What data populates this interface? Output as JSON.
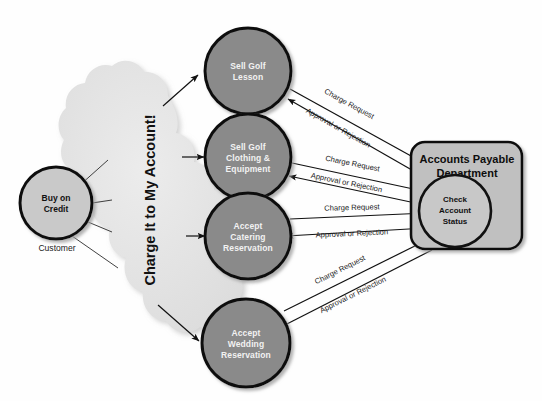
{
  "diagram": {
    "background_color": "#fefefe",
    "actor": {
      "label": "Customer",
      "node_label_line1": "Buy on",
      "node_label_line2": "Credit",
      "fill": "#c9c9c9",
      "stroke": "#111111"
    },
    "cloud": {
      "text": "Charge It to My Account!",
      "fill": "#e2e2e2"
    },
    "processes": [
      {
        "id": "sell-golf-lesson",
        "lines": [
          "Sell Golf",
          "Lesson"
        ],
        "fill": "#8a8a8a"
      },
      {
        "id": "sell-golf-clothing-equipment",
        "lines": [
          "Sell Golf",
          "Clothing &",
          "Equipment"
        ],
        "fill": "#8a8a8a"
      },
      {
        "id": "accept-catering-reservation",
        "lines": [
          "Accept",
          "Catering",
          "Reservation"
        ],
        "fill": "#8a8a8a"
      },
      {
        "id": "accept-wedding-reservation",
        "lines": [
          "Accept",
          "Wedding",
          "Reservation"
        ],
        "fill": "#8a8a8a"
      }
    ],
    "department": {
      "title_line1": "Accounts Payable",
      "title_line2": "Department",
      "fill": "#c0c0c0",
      "stroke": "#111111",
      "inner_process": {
        "lines": [
          "Check",
          "Account",
          "Status"
        ],
        "fill": "#c8c8c8"
      }
    },
    "edge_labels": {
      "charge_request": "Charge Request",
      "approval_or_rejection": "Approval or Rejection"
    },
    "flows": [
      {
        "from": "sell-golf-lesson",
        "to": "check-account-status",
        "label": "Charge Request"
      },
      {
        "from": "check-account-status",
        "to": "sell-golf-lesson",
        "label": "Approval or Rejection"
      },
      {
        "from": "sell-golf-clothing-equipment",
        "to": "check-account-status",
        "label": "Charge Request"
      },
      {
        "from": "check-account-status",
        "to": "sell-golf-clothing-equipment",
        "label": "Approval or Rejection"
      },
      {
        "from": "accept-catering-reservation",
        "to": "check-account-status",
        "label": "Charge Request"
      },
      {
        "from": "check-account-status",
        "to": "accept-catering-reservation",
        "label": "Approval or Rejection"
      },
      {
        "from": "accept-wedding-reservation",
        "to": "check-account-status",
        "label": "Charge Request"
      },
      {
        "from": "check-account-status",
        "to": "accept-wedding-reservation",
        "label": "Approval or Rejection"
      }
    ]
  }
}
